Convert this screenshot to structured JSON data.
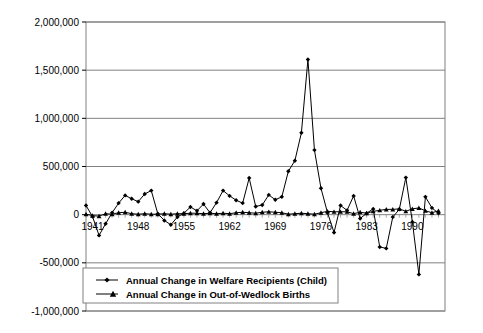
{
  "chart_data": {
    "type": "line",
    "title": "",
    "subtitle": "",
    "xlabel": "",
    "ylabel": "",
    "grid": true,
    "legend_position": "bottom-left-inside",
    "xlim": [
      1940,
      1995
    ],
    "ylim": [
      -1000000,
      2000000
    ],
    "y_ticks": [
      2000000,
      1500000,
      1000000,
      500000,
      0,
      -500000,
      -1000000
    ],
    "y_tick_labels": [
      "2,000,000",
      "1,500,000",
      "1,000,000",
      "500,000",
      "0",
      "-500,000",
      "-1,000,000"
    ],
    "x_ticks": [
      1941,
      1948,
      1955,
      1962,
      1969,
      1976,
      1983,
      1990
    ],
    "x_tick_labels": [
      "1941",
      "1948",
      "1955",
      "1962",
      "1969",
      "1976",
      "1983",
      "1990"
    ],
    "x": [
      1940,
      1941,
      1942,
      1943,
      1944,
      1945,
      1946,
      1947,
      1948,
      1949,
      1950,
      1951,
      1952,
      1953,
      1954,
      1955,
      1956,
      1957,
      1958,
      1959,
      1960,
      1961,
      1962,
      1963,
      1964,
      1965,
      1966,
      1967,
      1968,
      1969,
      1970,
      1971,
      1972,
      1973,
      1974,
      1975,
      1976,
      1977,
      1978,
      1979,
      1980,
      1981,
      1982,
      1983,
      1984,
      1985,
      1986,
      1987,
      1988,
      1989,
      1990,
      1991,
      1992,
      1993,
      1994
    ],
    "series": [
      {
        "name": "Annual Change in Welfare Recipients (Child)",
        "marker": "diamond",
        "color": "#000000",
        "values": [
          95000,
          -20000,
          -215000,
          -95000,
          20000,
          120000,
          200000,
          165000,
          135000,
          215000,
          250000,
          10000,
          -60000,
          -105000,
          -25000,
          15000,
          80000,
          40000,
          110000,
          20000,
          125000,
          250000,
          195000,
          150000,
          120000,
          380000,
          85000,
          100000,
          205000,
          155000,
          185000,
          450000,
          560000,
          850000,
          1610000,
          670000,
          275000,
          20000,
          -185000,
          95000,
          45000,
          195000,
          -40000,
          15000,
          60000,
          -335000,
          -350000,
          -25000,
          55000,
          385000,
          -75000,
          -620000,
          185000,
          70000,
          15000
        ]
      },
      {
        "name": "Annual Change in Out-of-Wedlock Births",
        "marker": "triangle",
        "color": "#000000",
        "values": [
          5000,
          -10000,
          -15000,
          10000,
          5000,
          20000,
          25000,
          10000,
          5000,
          10000,
          5000,
          5000,
          10000,
          5000,
          10000,
          10000,
          15000,
          15000,
          10000,
          15000,
          10000,
          15000,
          10000,
          20000,
          25000,
          20000,
          15000,
          25000,
          30000,
          25000,
          20000,
          5000,
          10000,
          15000,
          10000,
          5000,
          20000,
          35000,
          30000,
          30000,
          30000,
          10000,
          25000,
          15000,
          35000,
          45000,
          55000,
          55000,
          60000,
          35000,
          60000,
          70000,
          40000,
          20000,
          40000
        ]
      }
    ],
    "second_half_welfare": [
      45000,
      130000,
      60000,
      75000,
      120000,
      75000,
      65000,
      340000,
      585000,
      845000,
      295000,
      405000
    ]
  },
  "axis": {
    "y_labels": [
      "2,000,000",
      "1,500,000",
      "1,000,000",
      "500,000",
      "0",
      "-500,000",
      "-1,000,000"
    ],
    "x_labels": [
      "1941",
      "1948",
      "1955",
      "1962",
      "1969",
      "1976",
      "1983",
      "1990"
    ]
  },
  "legend": {
    "items": [
      {
        "label": "Annual Change in Welfare Recipients (Child)",
        "marker": "diamond"
      },
      {
        "label": "Annual Change in Out-of-Wedlock Births",
        "marker": "triangle"
      }
    ]
  }
}
